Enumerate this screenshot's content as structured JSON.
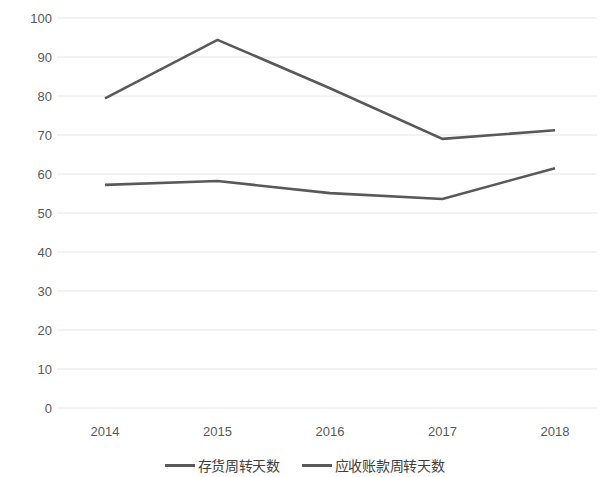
{
  "chart_data": {
    "type": "line",
    "title": "",
    "xlabel": "",
    "ylabel": "",
    "categories": [
      "2014",
      "2015",
      "2016",
      "2017",
      "2018"
    ],
    "series": [
      {
        "name": "存货周转天数",
        "color": "#595959",
        "values": [
          79.4,
          94.4,
          82.0,
          69.0,
          71.2
        ]
      },
      {
        "name": "应收账款周转天数",
        "color": "#595959",
        "values": [
          57.2,
          58.2,
          55.1,
          53.6,
          61.5
        ]
      }
    ],
    "ylim": [
      0,
      100
    ],
    "y_ticks": [
      "0",
      "10",
      "20",
      "30",
      "40",
      "50",
      "60",
      "70",
      "80",
      "90",
      "100"
    ],
    "grid": true,
    "grid_color": "#e6e6e6",
    "legend_position": "bottom",
    "background": "#ffffff"
  },
  "axis": {
    "tick_color": "#595959"
  }
}
